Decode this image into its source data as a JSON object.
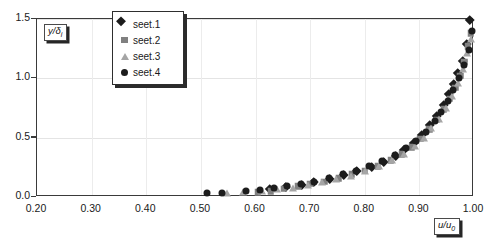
{
  "chart_data": {
    "type": "scatter",
    "title": "",
    "xlabel": "u/u0",
    "ylabel": "y/δi",
    "xlabel_display": "u/u",
    "xlabel_sub": "0",
    "ylabel_display": "y/δ",
    "ylabel_sub": "i",
    "xlim": [
      0.2,
      1.0
    ],
    "ylim": [
      0.0,
      1.5
    ],
    "xticks": [
      "0.20",
      "0.30",
      "0.40",
      "0.50",
      "0.60",
      "0.70",
      "0.80",
      "0.90",
      "1.00"
    ],
    "xtick_values": [
      0.2,
      0.3,
      0.4,
      0.5,
      0.6,
      0.7,
      0.8,
      0.9,
      1.0
    ],
    "yticks": [
      "0.0",
      "0.5",
      "1.0",
      "1.5"
    ],
    "ytick_values": [
      0.0,
      0.5,
      1.0,
      1.5
    ],
    "grid": true,
    "legend_position": "top-left-inside",
    "series": [
      {
        "name": "seet.1",
        "marker": "diamond",
        "color": "#1c1c1c",
        "points": [
          [
            0.632,
            0.04
          ],
          [
            0.662,
            0.06
          ],
          [
            0.69,
            0.08
          ],
          [
            0.712,
            0.1
          ],
          [
            0.742,
            0.13
          ],
          [
            0.768,
            0.16
          ],
          [
            0.792,
            0.19
          ],
          [
            0.818,
            0.23
          ],
          [
            0.84,
            0.27
          ],
          [
            0.862,
            0.32
          ],
          [
            0.878,
            0.37
          ],
          [
            0.895,
            0.43
          ],
          [
            0.91,
            0.5
          ],
          [
            0.925,
            0.58
          ],
          [
            0.938,
            0.66
          ],
          [
            0.95,
            0.75
          ],
          [
            0.96,
            0.84
          ],
          [
            0.968,
            0.93
          ],
          [
            0.976,
            1.02
          ],
          [
            0.985,
            1.12
          ],
          [
            0.993,
            1.26
          ],
          [
            0.999,
            1.47
          ]
        ]
      },
      {
        "name": "seet.2",
        "marker": "square",
        "color": "#808080",
        "points": [
          [
            0.604,
            0.04
          ],
          [
            0.628,
            0.05
          ],
          [
            0.652,
            0.07
          ],
          [
            0.678,
            0.09
          ],
          [
            0.7,
            0.11
          ],
          [
            0.726,
            0.13
          ],
          [
            0.752,
            0.16
          ],
          [
            0.776,
            0.19
          ],
          [
            0.8,
            0.22
          ],
          [
            0.824,
            0.26
          ],
          [
            0.848,
            0.31
          ],
          [
            0.868,
            0.36
          ],
          [
            0.886,
            0.42
          ],
          [
            0.902,
            0.49
          ],
          [
            0.918,
            0.57
          ],
          [
            0.932,
            0.65
          ],
          [
            0.945,
            0.74
          ],
          [
            0.956,
            0.83
          ],
          [
            0.966,
            0.92
          ],
          [
            0.975,
            1.02
          ],
          [
            0.982,
            1.14
          ],
          [
            0.989,
            1.27
          ],
          [
            0.994,
            1.38
          ]
        ]
      },
      {
        "name": "seet.3",
        "marker": "triangle",
        "color": "#a5a5a5",
        "points": [
          [
            0.548,
            0.03
          ],
          [
            0.578,
            0.04
          ],
          [
            0.612,
            0.05
          ],
          [
            0.64,
            0.07
          ],
          [
            0.668,
            0.08
          ],
          [
            0.696,
            0.1
          ],
          [
            0.722,
            0.13
          ],
          [
            0.748,
            0.15
          ],
          [
            0.774,
            0.18
          ],
          [
            0.8,
            0.22
          ],
          [
            0.826,
            0.26
          ],
          [
            0.85,
            0.31
          ],
          [
            0.872,
            0.36
          ],
          [
            0.892,
            0.43
          ],
          [
            0.908,
            0.5
          ],
          [
            0.922,
            0.58
          ],
          [
            0.936,
            0.66
          ],
          [
            0.948,
            0.75
          ],
          [
            0.96,
            0.85
          ],
          [
            0.97,
            0.96
          ],
          [
            0.979,
            1.08
          ],
          [
            0.988,
            1.21
          ],
          [
            0.995,
            1.33
          ]
        ]
      },
      {
        "name": "seet.4",
        "marker": "circle",
        "color": "#1c1c1c",
        "points": [
          [
            0.512,
            0.03
          ],
          [
            0.538,
            0.03
          ],
          [
            0.582,
            0.05
          ],
          [
            0.608,
            0.06
          ],
          [
            0.634,
            0.08
          ],
          [
            0.658,
            0.09
          ],
          [
            0.684,
            0.11
          ],
          [
            0.708,
            0.13
          ],
          [
            0.734,
            0.16
          ],
          [
            0.76,
            0.19
          ],
          [
            0.784,
            0.22
          ],
          [
            0.808,
            0.26
          ],
          [
            0.832,
            0.3
          ],
          [
            0.856,
            0.35
          ],
          [
            0.876,
            0.41
          ],
          [
            0.894,
            0.47
          ],
          [
            0.912,
            0.55
          ],
          [
            0.928,
            0.64
          ],
          [
            0.94,
            0.72
          ],
          [
            0.952,
            0.81
          ],
          [
            0.962,
            0.9
          ],
          [
            0.972,
            1.0
          ],
          [
            0.981,
            1.11
          ],
          [
            0.99,
            1.24
          ],
          [
            0.997,
            1.4
          ]
        ]
      }
    ]
  }
}
